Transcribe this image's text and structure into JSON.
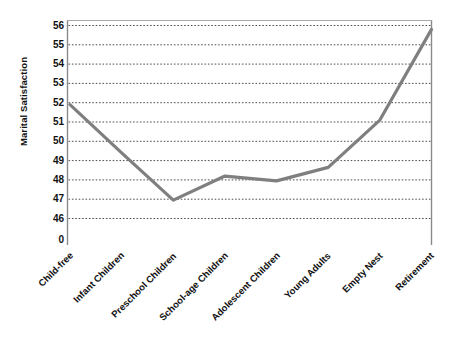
{
  "chart_data": {
    "type": "line",
    "title": "",
    "xlabel": "",
    "ylabel": "Marital Satisfaction",
    "categories": [
      "Child-free",
      "Infant Children",
      "Preschool Children",
      "School-age Children",
      "Adolescent Children",
      "Young Adults",
      "Empty Nest",
      "Retirement"
    ],
    "values": [
      51.9,
      49.4,
      46.95,
      48.2,
      47.95,
      48.65,
      51.1,
      55.8
    ],
    "series": [
      {
        "name": "Marital Satisfaction",
        "values": [
          51.9,
          49.4,
          46.95,
          48.2,
          47.95,
          48.65,
          51.1,
          55.8
        ]
      }
    ],
    "ylim": [
      45.5,
      56.3
    ],
    "ytick_labels": [
      "56",
      "55",
      "54",
      "53",
      "52",
      "51",
      "50",
      "49",
      "48",
      "47",
      "46",
      "0"
    ],
    "ytick_values": [
      56,
      55,
      54,
      53,
      52,
      51,
      50,
      49,
      48,
      47,
      46
    ],
    "zero_label": "0",
    "grid": "horizontal-dotted",
    "legend": "none",
    "line_color": "#7f7f7f",
    "grid_color": "#3a3a3a",
    "axis_color": "#7f7f7f",
    "background_color": "#ffffff"
  }
}
